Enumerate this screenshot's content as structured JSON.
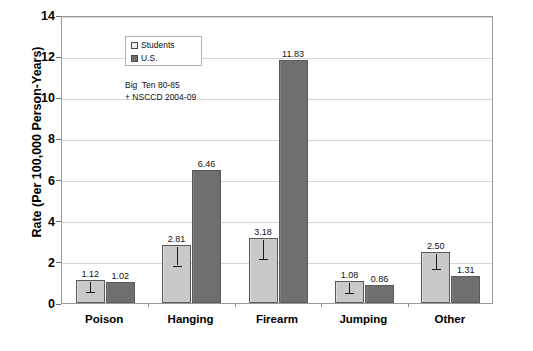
{
  "chart_data": {
    "type": "bar",
    "title": "",
    "xlabel": "",
    "ylabel": "Rate (Per 100,000 Person-Years)",
    "categories": [
      "Poison",
      "Hanging",
      "Firearm",
      "Jumping",
      "Other"
    ],
    "series": [
      {
        "name": "Students",
        "values": [
          1.12,
          2.81,
          3.18,
          1.08,
          2.5
        ],
        "labels": [
          "1.12",
          "2.81",
          "3.18",
          "1.08",
          "2.50"
        ],
        "color": "#c9c9c9",
        "error_low": [
          0.62,
          1.92,
          2.26,
          0.6,
          1.74
        ]
      },
      {
        "name": "U.S.",
        "values": [
          1.02,
          6.46,
          11.83,
          0.86,
          1.31
        ],
        "labels": [
          "1.02",
          "6.46",
          "11.83",
          "0.86",
          "1.31"
        ],
        "color": "#6f6f6f",
        "error_low": [
          null,
          null,
          null,
          null,
          null
        ]
      }
    ],
    "ylim": [
      0,
      14
    ],
    "yticks": [
      0,
      2,
      4,
      6,
      8,
      10,
      12,
      14
    ],
    "ytick_labels": [
      "0",
      "2",
      "4",
      "6",
      "8",
      "10",
      "12",
      "14"
    ],
    "grid": true,
    "legend": {
      "position": "top-left",
      "entries": [
        {
          "label": "Students",
          "swatch": "students"
        },
        {
          "label": "U.S.",
          "swatch": "us"
        }
      ]
    },
    "annotations": [
      {
        "text": "Big  Ten 80-85\n+ NSCCD 2004-09"
      }
    ]
  }
}
